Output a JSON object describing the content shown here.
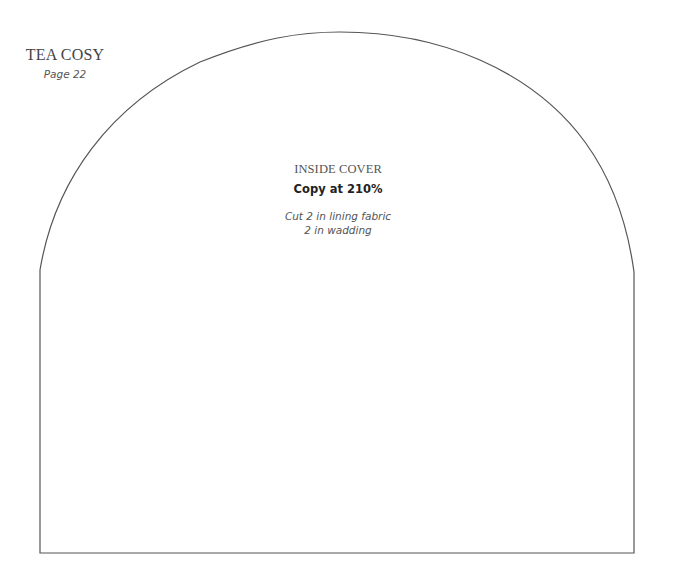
{
  "header": {
    "title": "TEA COSY",
    "page_ref": "Page 22"
  },
  "pattern_piece": {
    "name": "INSIDE COVER",
    "copy_instruction": "Copy at 210%",
    "cut_instructions": [
      "Cut 2 in lining fabric",
      "2 in wadding"
    ],
    "outline_color": "#555555"
  }
}
